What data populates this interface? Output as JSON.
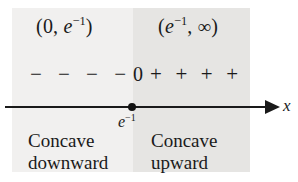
{
  "figure": {
    "type": "sign-chart",
    "axis": {
      "variable_label": "x",
      "critical_point_label_base": "e",
      "critical_point_label_exponent": "−1"
    },
    "regions": [
      {
        "id": "left",
        "interval_open": "(",
        "interval_first": "0",
        "interval_separator": ", ",
        "interval_base": "e",
        "interval_exponent": "−1",
        "interval_close": ")",
        "sign_symbol": "−",
        "sign_count": 4,
        "signs": [
          "−",
          "−",
          "−",
          "−"
        ],
        "caption_line1": "Concave",
        "caption_line2": "downward",
        "fill": "#f1f0ef"
      },
      {
        "id": "right",
        "interval_open": "(",
        "interval_base": "e",
        "interval_exponent": "−1",
        "interval_separator": ", ",
        "interval_last": "∞",
        "interval_close": ")",
        "sign_symbol": "+",
        "sign_count": 4,
        "signs": [
          "+",
          "+",
          "+",
          "+"
        ],
        "caption_line1": "Concave",
        "caption_line2": "upward",
        "fill": "#e6e5e3"
      }
    ],
    "boundary_sign": "0",
    "colors": {
      "ink": "#1a1a1a",
      "background": "#ffffff",
      "band_left": "#f1f0ef",
      "band_right": "#e6e5e3"
    }
  }
}
